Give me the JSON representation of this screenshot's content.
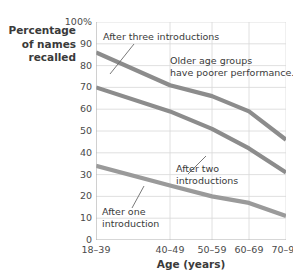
{
  "chart_data": {
    "type": "line",
    "title": "",
    "xlabel": "Age (years)",
    "ylabel": "Percentage of names recalled",
    "categories": [
      "18–39",
      "40–49",
      "50–59",
      "60–69",
      "70–90"
    ],
    "ylim": [
      0,
      100
    ],
    "ytick_values": [
      100,
      90,
      80,
      70,
      60,
      50,
      40,
      30,
      20,
      10,
      0
    ],
    "ytick_labels": [
      "100%",
      "90",
      "80",
      "70",
      "60",
      "50",
      "40",
      "30",
      "20",
      "10",
      "0"
    ],
    "grid": true,
    "legend_position": "none",
    "series": [
      {
        "name": "After three introductions",
        "values": [
          86,
          71,
          66,
          59,
          46
        ],
        "color": "#8c8c8c"
      },
      {
        "name": "After two introductions",
        "values": [
          70,
          59,
          51,
          42,
          31
        ],
        "color": "#8c8c8c"
      },
      {
        "name": "After one introduction",
        "values": [
          34,
          25,
          20,
          17,
          11
        ],
        "color": "#9a9a9a"
      }
    ],
    "annotations": [
      {
        "id": "after-three",
        "text": "After three introductions"
      },
      {
        "id": "older-groups",
        "line1": "Older age groups",
        "line2": "have poorer performance."
      },
      {
        "id": "after-two",
        "line1": "After two",
        "line2": "introductions"
      },
      {
        "id": "after-one",
        "line1": "After one",
        "line2": "introduction"
      }
    ]
  },
  "axis": {
    "ylabel_line1": "Percentage",
    "ylabel_line2": "of names",
    "ylabel_line3": "recalled",
    "xtitle": "Age (years)"
  },
  "colors": {
    "line": "#8c8c8c",
    "grid": "#d8d8d8",
    "axis": "#b4b4b4",
    "text": "#3a3a3a",
    "background": "#ffffff"
  }
}
